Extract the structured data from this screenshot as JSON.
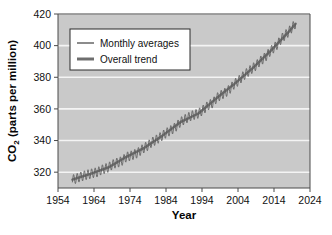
{
  "figure": {
    "background_color": "#ffffff",
    "plot_background_color": "#c9c9c9",
    "gridline_color": "#f4f4f4",
    "axis_color": "#4a4a4a",
    "series_color": "#5b5b5b",
    "trend_color": "#6e6e6e"
  },
  "chart_data": {
    "type": "line",
    "title": "",
    "xlabel": "Year",
    "ylabel": "CO2 (parts per million)",
    "ylabel_parts": {
      "prefix": "CO",
      "subscript": "2",
      "suffix": " (parts per million)"
    },
    "xlim": [
      1954,
      2024
    ],
    "ylim": [
      310,
      420
    ],
    "grid": true,
    "xticks": [
      1954,
      1964,
      1974,
      1984,
      1994,
      2004,
      2014,
      2024
    ],
    "yticks": [
      320,
      340,
      360,
      380,
      400,
      420
    ],
    "legend_position": "upper left",
    "legend": [
      {
        "name": "Monthly averages",
        "style": "thin-line",
        "color": "#5b5b5b"
      },
      {
        "name": "Overall trend",
        "style": "thick-line",
        "color": "#6e6e6e"
      }
    ],
    "series": [
      {
        "name": "Monthly averages",
        "description": "Mauna Loa monthly mean CO2 with seasonal sawtooth oscillation of about 6 ppm peak-to-peak",
        "seasonal_amplitude_ppm": 3.0,
        "x": [
          1958,
          1959,
          1960,
          1961,
          1962,
          1963,
          1964,
          1965,
          1966,
          1967,
          1968,
          1969,
          1970,
          1971,
          1972,
          1973,
          1974,
          1975,
          1976,
          1977,
          1978,
          1979,
          1980,
          1981,
          1982,
          1983,
          1984,
          1985,
          1986,
          1987,
          1988,
          1989,
          1990,
          1991,
          1992,
          1993,
          1994,
          1995,
          1996,
          1997,
          1998,
          1999,
          2000,
          2001,
          2002,
          2003,
          2004,
          2005,
          2006,
          2007,
          2008,
          2009,
          2010,
          2011,
          2012,
          2013,
          2014,
          2015,
          2016,
          2017,
          2018,
          2019,
          2020
        ],
        "values": [
          315.3,
          315.9,
          316.9,
          317.6,
          318.4,
          318.9,
          319.6,
          320.0,
          321.4,
          322.2,
          323.0,
          324.6,
          325.7,
          326.3,
          327.5,
          329.7,
          330.2,
          331.1,
          332.0,
          333.8,
          335.4,
          336.8,
          338.8,
          340.1,
          341.5,
          343.1,
          344.7,
          346.0,
          347.4,
          349.2,
          351.6,
          353.1,
          354.4,
          355.6,
          356.4,
          357.1,
          358.8,
          360.8,
          362.6,
          363.7,
          366.7,
          368.4,
          369.6,
          371.1,
          373.2,
          375.8,
          377.5,
          379.8,
          381.9,
          383.8,
          385.6,
          387.4,
          389.9,
          391.6,
          393.8,
          396.5,
          398.6,
          400.8,
          404.2,
          406.5,
          408.5,
          411.4,
          413.9
        ]
      },
      {
        "name": "Overall trend",
        "description": "Smoothed long-term trend through the monthly averages",
        "x": [
          1958,
          1963,
          1968,
          1973,
          1978,
          1983,
          1988,
          1993,
          1998,
          2003,
          2008,
          2013,
          2018,
          2020
        ],
        "values": [
          315.3,
          318.9,
          323.0,
          329.7,
          335.4,
          343.1,
          351.6,
          357.1,
          366.7,
          375.8,
          385.6,
          396.5,
          408.5,
          413.9
        ]
      }
    ]
  }
}
